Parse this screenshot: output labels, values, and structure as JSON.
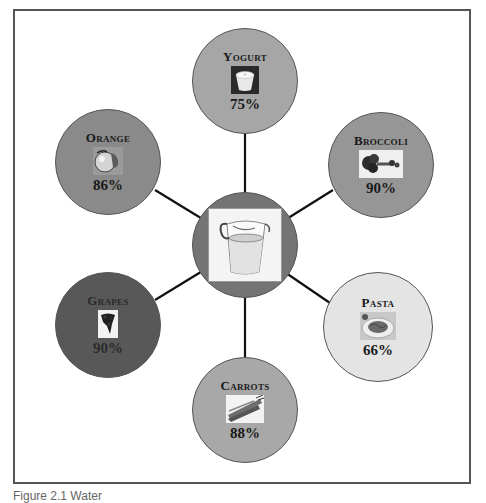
{
  "diagram": {
    "type": "hub-and-spoke",
    "center": {
      "name": "Water",
      "icon": "water-pitcher-icon"
    },
    "nodes": [
      {
        "key": "yogurt",
        "label": "Yogurt",
        "value": "75%",
        "icon": "yogurt-cup-icon",
        "fill": "#a6a6a6",
        "text": "#1a1a1a"
      },
      {
        "key": "broccoli",
        "label": "Broccoli",
        "value": "90%",
        "icon": "broccoli-icon",
        "fill": "#969696",
        "text": "#1a1a1a"
      },
      {
        "key": "pasta",
        "label": "Pasta",
        "value": "66%",
        "icon": "pasta-plate-icon",
        "fill": "#e4e4e4",
        "text": "#1a1a1a"
      },
      {
        "key": "carrots",
        "label": "Carrots",
        "value": "88%",
        "icon": "carrots-icon",
        "fill": "#a8a8a8",
        "text": "#1a1a1a"
      },
      {
        "key": "grapes",
        "label": "Grapes",
        "value": "90%",
        "icon": "grapes-icon",
        "fill": "#585858",
        "text": "#2b2b2b"
      },
      {
        "key": "orange",
        "label": "Orange",
        "value": "86%",
        "icon": "orange-fruit-icon",
        "fill": "#8a8a8a",
        "text": "#1a1a1a"
      }
    ],
    "center_fill": "#747474",
    "line_color": "#111111",
    "frame_color": "#555555"
  },
  "caption": "Figure 2.1  Water"
}
